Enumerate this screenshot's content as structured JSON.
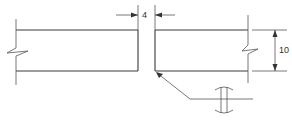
{
  "diagram": {
    "type": "butt weld joint drawing",
    "gap_dimension": {
      "label": "4"
    },
    "thickness_dimension": {
      "label": "10"
    },
    "weld_symbol": "square butt weld (double-sided, with curved contour marks)",
    "leader": "arrow pointing to lower joint corner of right plate"
  }
}
